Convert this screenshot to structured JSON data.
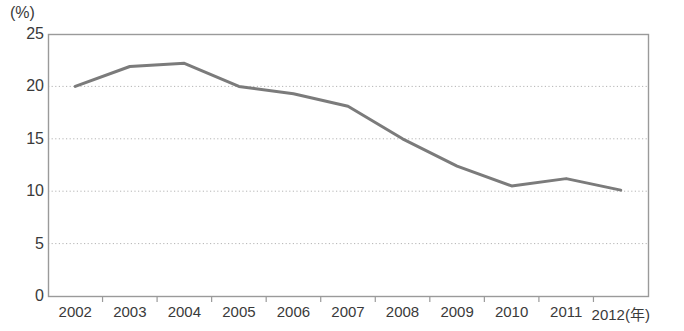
{
  "chart_data": {
    "type": "line",
    "title": "",
    "subtitle": "",
    "xlabel": "(年)",
    "ylabel": "(%)",
    "categories": [
      "2002",
      "2003",
      "2004",
      "2005",
      "2006",
      "2007",
      "2008",
      "2009",
      "2010",
      "2011",
      "2012"
    ],
    "x": [
      2002,
      2003,
      2004,
      2005,
      2006,
      2007,
      2008,
      2009,
      2010,
      2011,
      2012
    ],
    "values": [
      20.0,
      21.9,
      22.2,
      20.0,
      19.3,
      18.1,
      15.0,
      12.4,
      10.5,
      11.2,
      10.1
    ],
    "series": [
      {
        "name": "",
        "values": [
          20.0,
          21.9,
          22.2,
          20.0,
          19.3,
          18.1,
          15.0,
          12.4,
          10.5,
          11.2,
          10.1
        ]
      }
    ],
    "ylim": [
      0,
      25
    ],
    "yticks": [
      0,
      5,
      10,
      15,
      20,
      25
    ],
    "ytick_labels": [
      "0",
      "5",
      "10",
      "15",
      "20",
      "25"
    ],
    "xtick_labels": [
      "2002",
      "2003",
      "2004",
      "2005",
      "2006",
      "2007",
      "2008",
      "2009",
      "2010",
      "2011",
      "2012"
    ],
    "x_axis_suffix": "(年)",
    "grid": true,
    "grid_style": "dotted-horizontal",
    "legend": "none",
    "line_color": "#7b7b7b",
    "grid_color": "#b4b4b4",
    "frame_color": "#9a9a9a",
    "text_color": "#3a3a3a"
  },
  "axes": {
    "y_unit": "(%)",
    "x_unit": "(年)"
  }
}
